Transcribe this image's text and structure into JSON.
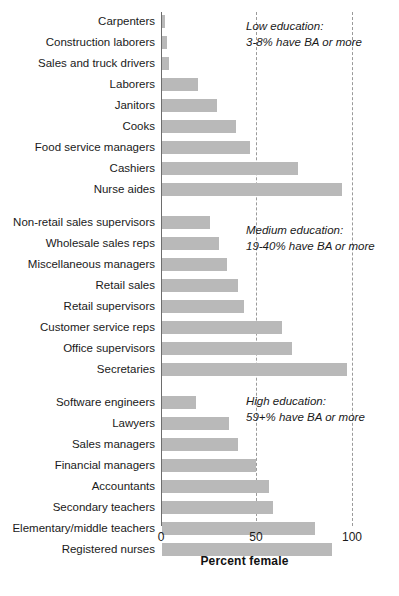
{
  "chart_data": {
    "type": "bar",
    "orientation": "horizontal",
    "title": "",
    "xlabel": "Percent female",
    "ylabel": "",
    "xlim": [
      0,
      100
    ],
    "xticks": [
      "0",
      "50",
      "100"
    ],
    "xtick_values": [
      0,
      50,
      100
    ],
    "grid": "vertical dashed gridlines at 50 and 100",
    "legend": "none",
    "bar_color": "#b9b9b9",
    "axis_color": "#6d6d6d",
    "gridline_color": "#9a9a9a",
    "groups": [
      {
        "id": "low",
        "annotation_line1": "Low education:",
        "annotation_line2": "3-8% have BA or more",
        "categories": [
          "Carpenters",
          "Construction laborers",
          "Sales and truck drivers",
          "Laborers",
          "Janitors",
          "Cooks",
          "Food service managers",
          "Cashiers",
          "Nurse aides"
        ],
        "values": [
          1.5,
          2.5,
          3.5,
          19,
          29,
          39,
          46,
          71,
          94
        ]
      },
      {
        "id": "medium",
        "annotation_line1": "Medium education:",
        "annotation_line2": "19-40% have BA or more",
        "categories": [
          "Non-retail sales supervisors",
          "Wholesale sales reps",
          "Miscellaneous managers",
          "Retail sales",
          "Retail supervisors",
          "Customer service reps",
          "Office supervisors",
          "Secretaries"
        ],
        "values": [
          25,
          30,
          34,
          40,
          43,
          63,
          68,
          97
        ]
      },
      {
        "id": "high",
        "annotation_line1": "High education:",
        "annotation_line2": "59+% have BA or more",
        "categories": [
          "Software engineers",
          "Lawyers",
          "Sales managers",
          "Financial managers",
          "Accountants",
          "Secondary teachers",
          "Elementary/middle teachers",
          "Registered nurses"
        ],
        "values": [
          18,
          35,
          40,
          49,
          56,
          58,
          80,
          89
        ]
      }
    ]
  },
  "axis": {
    "tick_0": "0",
    "tick_50": "50",
    "tick_100": "100",
    "x_title": "Percent female"
  },
  "annotations": {
    "low": {
      "line1": "Low education:",
      "line2": "3-8% have BA or more"
    },
    "medium": {
      "line1": "Medium education:",
      "line2": "19-40% have BA or more"
    },
    "high": {
      "line1": "High education:",
      "line2": "59+% have BA or more"
    }
  }
}
